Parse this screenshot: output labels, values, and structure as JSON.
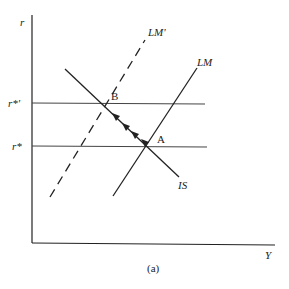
{
  "diagram": {
    "caption": "(a)",
    "axes": {
      "y_label": "r",
      "x_label": "Y"
    },
    "levels": [
      {
        "name": "r-star-prime",
        "label": "r*'"
      },
      {
        "name": "r-star",
        "label": "r*"
      }
    ],
    "curves": [
      {
        "name": "LM-prime",
        "label": "LM'",
        "style": "dashed"
      },
      {
        "name": "LM",
        "label": "LM",
        "style": "solid"
      },
      {
        "name": "IS",
        "label": "IS",
        "style": "solid"
      }
    ],
    "points": [
      {
        "name": "B",
        "label": "B"
      },
      {
        "name": "A",
        "label": "A"
      }
    ],
    "colors": {
      "line": "#222222",
      "level_line": "#444444",
      "background": "#ffffff"
    }
  }
}
